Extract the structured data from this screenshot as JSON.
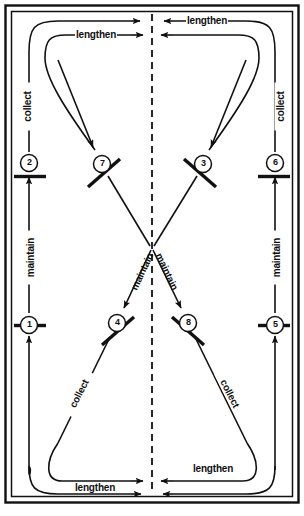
{
  "diagram": {
    "frame": {
      "outer_border_color": "#111111",
      "inner_border_color": "#111111",
      "background": "#ffffff",
      "centerline_style": "dashed-vertical"
    },
    "nodes": [
      {
        "id": "1",
        "label": "1",
        "x": 29,
        "y": 325,
        "barrier": "horizontal",
        "side": "left-lower"
      },
      {
        "id": "2",
        "label": "2",
        "x": 29,
        "y": 163,
        "barrier": "horizontal",
        "side": "left-upper"
      },
      {
        "id": "3",
        "label": "3",
        "x": 203,
        "y": 164,
        "barrier": "diagonal-down",
        "side": "center-upper-right"
      },
      {
        "id": "4",
        "label": "4",
        "x": 117,
        "y": 323,
        "barrier": "diagonal-up",
        "side": "center-lower-left"
      },
      {
        "id": "5",
        "label": "5",
        "x": 275,
        "y": 325,
        "barrier": "horizontal",
        "side": "right-lower"
      },
      {
        "id": "6",
        "label": "6",
        "x": 275,
        "y": 163,
        "barrier": "horizontal",
        "side": "right-upper"
      },
      {
        "id": "7",
        "label": "7",
        "x": 102,
        "y": 164,
        "barrier": "diagonal-up",
        "side": "center-upper-left"
      },
      {
        "id": "8",
        "label": "8",
        "x": 188,
        "y": 323,
        "barrier": "diagonal-down",
        "side": "center-lower-right"
      }
    ],
    "edge_labels": [
      {
        "id": "lengthen-top-left",
        "text": "lengthen",
        "x": 107,
        "y": 35,
        "rotation": 0
      },
      {
        "id": "lengthen-top-right",
        "text": "lengthen",
        "x": 219,
        "y": 20,
        "rotation": 0
      },
      {
        "id": "lengthen-bottom-left",
        "text": "lengthen",
        "x": 106,
        "y": 488,
        "rotation": 0
      },
      {
        "id": "lengthen-bottom-right",
        "text": "lengthen",
        "x": 224,
        "y": 470,
        "rotation": 0
      },
      {
        "id": "collect-left-outer",
        "text": "collect",
        "x": 25,
        "y": 106,
        "rotation": -90
      },
      {
        "id": "collect-right-outer",
        "text": "collect",
        "x": 279,
        "y": 106,
        "rotation": -90
      },
      {
        "id": "collect-lower-left",
        "text": "collect",
        "x": 78,
        "y": 393,
        "rotation": -55
      },
      {
        "id": "collect-lower-right",
        "text": "collect",
        "x": 229,
        "y": 393,
        "rotation": 55
      },
      {
        "id": "maintain-left",
        "text": "maintain",
        "x": 25,
        "y": 258,
        "rotation": -90
      },
      {
        "id": "maintain-right",
        "text": "maintain",
        "x": 279,
        "y": 258,
        "rotation": -90
      },
      {
        "id": "maintain-center-left",
        "text": "maintain",
        "x": 141,
        "y": 272,
        "rotation": -68
      },
      {
        "id": "maintain-center-right",
        "text": "maintain",
        "x": 166,
        "y": 272,
        "rotation": 68
      }
    ],
    "colors": {
      "ink": "#111111",
      "label_text": "#101010",
      "paper": "#ffffff"
    }
  }
}
